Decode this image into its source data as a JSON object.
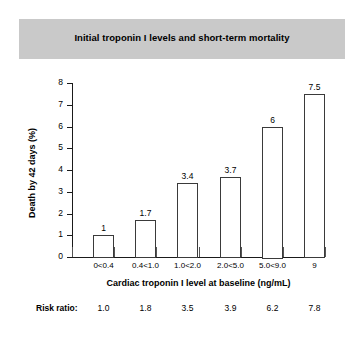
{
  "figure": {
    "title": "Initial troponin I levels and short-term mortality",
    "title_band_color": "#c9c9c9",
    "background_color": "#ffffff"
  },
  "risk_ratio": {
    "label": "Risk ratio:",
    "values": [
      "1.0",
      "1.8",
      "3.5",
      "3.9",
      "6.2",
      "7.8"
    ]
  },
  "chart_data": {
    "type": "bar",
    "title": "Initial troponin I levels and short-term mortality",
    "xlabel": "Cardiac troponin I level at baseline (ng/mL)",
    "ylabel": "Death by 42 days (%)",
    "categories": [
      "0<0.4",
      "0.4<1.0",
      "1.0<2.0",
      "2.0<5.0",
      "5.0<9.0",
      "9"
    ],
    "values": [
      1,
      1.7,
      3.4,
      3.7,
      6,
      7.5
    ],
    "value_labels": [
      "1",
      "1.7",
      "3.4",
      "3.7",
      "6",
      "7.5"
    ],
    "risk_ratios": [
      1.0,
      1.8,
      3.5,
      3.9,
      6.2,
      7.8
    ],
    "ylim": [
      0,
      8
    ],
    "yticks": [
      0,
      1,
      2,
      3,
      4,
      5,
      6,
      7,
      8
    ],
    "ytick_labels": [
      "0",
      "1",
      "2",
      "3",
      "4",
      "5",
      "6",
      "7",
      "8"
    ],
    "grid": false,
    "legend": null,
    "bar_face_color": "#ffffff",
    "bar_edge_color": "#3a3a3a",
    "axis_color": "#1a1a1a"
  }
}
